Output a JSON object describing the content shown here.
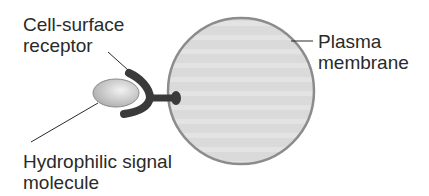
{
  "labels": {
    "receptor": [
      "Cell-surface",
      "receptor"
    ],
    "membrane": [
      "Plasma",
      "membrane"
    ],
    "signal": [
      "Hydrophilic signal",
      "molecule"
    ]
  },
  "colors": {
    "cell_fill": "#d9d9d9",
    "cell_outline": "#8c8c8c",
    "receptor": "#3a3a3a",
    "molecule_fill": "#c8c8c8",
    "text": "#2a2a2a"
  }
}
